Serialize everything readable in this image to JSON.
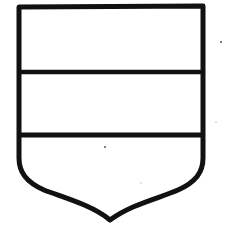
{
  "diagram": {
    "type": "heraldic-shield",
    "division": "tierced per fess",
    "sections": [
      {
        "name": "chief",
        "position": "top"
      },
      {
        "name": "fess",
        "position": "middle"
      },
      {
        "name": "base",
        "position": "bottom"
      }
    ],
    "colors": {
      "stroke": "#111111",
      "field": "#ffffff",
      "background": "#ffffff"
    }
  }
}
